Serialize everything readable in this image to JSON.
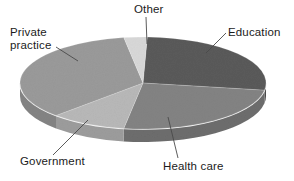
{
  "chart_data": {
    "type": "pie",
    "title": "",
    "subtitle": "",
    "xlabel": "",
    "ylabel": "",
    "legend_position": "none",
    "grid": false,
    "three_d": true,
    "categories": [
      "Education",
      "Health care",
      "Government",
      "Private practice",
      "Other"
    ],
    "values": [
      27,
      25,
      10,
      35,
      3
    ],
    "units": "percent",
    "slices": [
      {
        "label": "Education",
        "value": 27,
        "color": "#5a5a5a",
        "side_color": "#4a4a4a",
        "start_angle": 272,
        "end_angle": 369
      },
      {
        "label": "Health care",
        "value": 25,
        "color": "#838383",
        "side_color": "#6d6d6d",
        "start_angle": 9,
        "end_angle": 99
      },
      {
        "label": "Government",
        "value": 10,
        "color": "#b8b8b8",
        "side_color": "#9c9c9c",
        "start_angle": 99,
        "end_angle": 135
      },
      {
        "label": "Private practice",
        "value": 35,
        "color": "#9a9a9a",
        "side_color": "#848484",
        "start_angle": 135,
        "end_angle": 261
      },
      {
        "label": "Other",
        "value": 3,
        "color": "#d8d8d8",
        "side_color": "#c0c0c0",
        "start_angle": 261,
        "end_angle": 272
      }
    ],
    "geometry": {
      "cx": 143,
      "cy": 83,
      "rx": 123,
      "ry": 46,
      "depth": 13
    },
    "colors": {
      "background": "#ffffff",
      "text": "#1b1b1b",
      "leader_line": "#4a4a4a",
      "rim_highlight": "#f2f2f2"
    }
  },
  "labels": {
    "other": "Other",
    "education": "Education",
    "private_practice_line1": "Private",
    "private_practice_line2": "practice",
    "government": "Government",
    "health_care": "Health care"
  }
}
